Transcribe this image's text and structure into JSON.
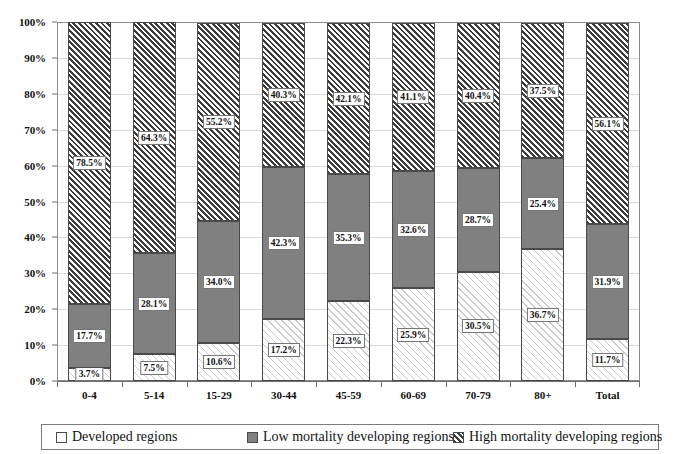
{
  "chart_data": {
    "type": "bar",
    "subtype": "stacked-100-percent",
    "title": "",
    "subtitle": "",
    "xlabel": "",
    "ylabel": "",
    "ylim": [
      0,
      100
    ],
    "y_tick_labels": [
      "0%",
      "10%",
      "20%",
      "30%",
      "40%",
      "50%",
      "60%",
      "70%",
      "80%",
      "90%",
      "100%"
    ],
    "y_tick_values": [
      0,
      10,
      20,
      30,
      40,
      50,
      60,
      70,
      80,
      90,
      100
    ],
    "grid": true,
    "grid_axis": "y",
    "legend_position": "bottom",
    "categories": [
      "0-4",
      "5-14",
      "15-29",
      "30-44",
      "45-59",
      "60-69",
      "70-79",
      "80+",
      "Total"
    ],
    "series": [
      {
        "name": "Developed regions",
        "fill": "light-diagonal-hatch",
        "color": "#ffffff",
        "values": [
          3.7,
          7.5,
          10.6,
          17.2,
          22.3,
          25.9,
          30.5,
          36.7,
          11.7
        ],
        "labels": [
          "3.7%",
          "7.5%",
          "10.6%",
          "17.2%",
          "22.3%",
          "25.9%",
          "30.5%",
          "36.7%",
          "11.7%"
        ]
      },
      {
        "name": "Low mortality developing regions",
        "fill": "solid",
        "color": "#808080",
        "values": [
          17.7,
          28.1,
          34.0,
          42.3,
          35.3,
          32.6,
          28.7,
          25.4,
          31.9
        ],
        "labels": [
          "17.7%",
          "28.1%",
          "34.0%",
          "42.3%",
          "35.3%",
          "32.6%",
          "28.7%",
          "25.4%",
          "31.9%"
        ]
      },
      {
        "name": "High mortality developing regions",
        "fill": "dark-diagonal-hatch",
        "color": "#3c3c3c",
        "values": [
          78.5,
          64.3,
          55.2,
          40.3,
          42.1,
          41.1,
          40.4,
          37.5,
          56.1
        ],
        "labels": [
          "78.5%",
          "64.3%",
          "55.2%",
          "40.3%",
          "42.1%",
          "41.1%",
          "40.4%",
          "37.5%",
          "56.1%"
        ]
      }
    ]
  },
  "legend": {
    "items": [
      {
        "label": "Developed regions",
        "swatch": "swatch-developed"
      },
      {
        "label": "Low mortality developing regions",
        "swatch": "swatch-low-mortality"
      },
      {
        "label": "High mortality developing regions",
        "swatch": "swatch-high-mortality"
      }
    ]
  }
}
